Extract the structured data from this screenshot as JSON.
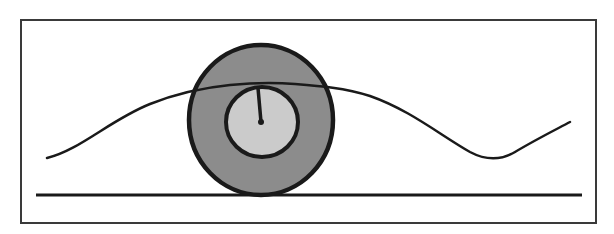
{
  "diagram": {
    "title": "Wheel rolling over wavy bump on a flat surface",
    "frame": {
      "x": 21,
      "y": 20,
      "width": 575,
      "height": 203,
      "stroke": "#3a3a3a"
    },
    "ground_line": {
      "x1": 36,
      "y1": 195,
      "x2": 582,
      "y2": 195,
      "stroke": "#1a1a1a"
    },
    "wave_path": "M 47 158 C 80 150, 110 120, 150 104 C 175 94, 200 88, 230 85 C 250 83, 270 82, 295 84 C 320 86, 345 88, 370 96 C 410 110, 440 135, 470 152 C 485 160, 500 161, 515 152 C 535 140, 555 130, 570 122",
    "wheel": {
      "cx": 261,
      "cy": 120,
      "rx": 72,
      "ry": 75,
      "fill": "#8c8c8c",
      "stroke": "#1a1a1a",
      "hub": {
        "cx": 262,
        "cy": 122,
        "rx": 36,
        "ry": 35,
        "fill": "#cbcbcb"
      },
      "spoke": {
        "x1": 261,
        "y1": 122,
        "x2": 258,
        "y2": 88
      },
      "center_dot_r": 3
    },
    "colors": {
      "background": "#ffffff",
      "line": "#1a1a1a",
      "tire": "#8c8c8c",
      "hub": "#cbcbcb"
    }
  }
}
